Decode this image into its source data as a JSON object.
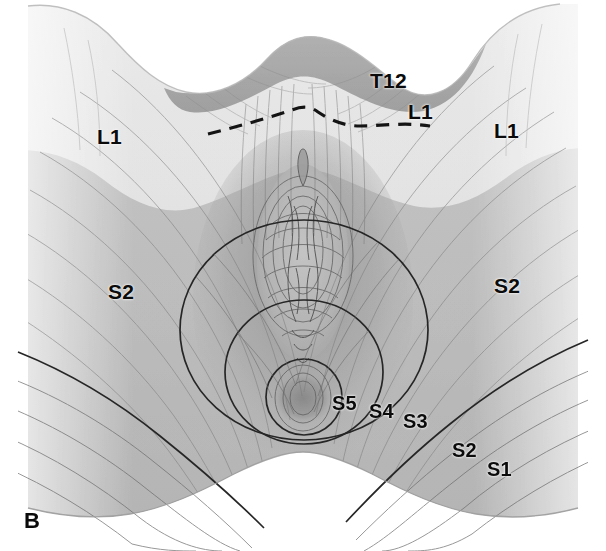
{
  "figure": {
    "panel_label": "B",
    "background_color": "#ffffff",
    "width": 606,
    "height": 551
  },
  "labels": [
    {
      "id": "t12",
      "text": "T12",
      "x": 370,
      "y": 70,
      "size": "lg"
    },
    {
      "id": "l1-center",
      "text": "L1",
      "x": 408,
      "y": 101,
      "size": "lg"
    },
    {
      "id": "l1-left",
      "text": "L1",
      "x": 97,
      "y": 126,
      "size": "lg"
    },
    {
      "id": "l1-right",
      "text": "L1",
      "x": 494,
      "y": 120,
      "size": "lg"
    },
    {
      "id": "s2-left",
      "text": "S2",
      "x": 108,
      "y": 281,
      "size": "lg"
    },
    {
      "id": "s2-right",
      "text": "S2",
      "x": 494,
      "y": 275,
      "size": "lg"
    },
    {
      "id": "s5",
      "text": "S5",
      "x": 332,
      "y": 393,
      "size": "md"
    },
    {
      "id": "s4",
      "text": "S4",
      "x": 369,
      "y": 401,
      "size": "md"
    },
    {
      "id": "s3",
      "text": "S3",
      "x": 403,
      "y": 411,
      "size": "md"
    },
    {
      "id": "s2-lower",
      "text": "S2",
      "x": 452,
      "y": 440,
      "size": "md"
    },
    {
      "id": "s1",
      "text": "S1",
      "x": 487,
      "y": 459,
      "size": "md"
    }
  ],
  "dermatome_zones": [
    {
      "id": "t12",
      "label": "T12",
      "tone": "#9a9a9a",
      "region": "upper lower-back band"
    },
    {
      "id": "l1",
      "label": "L1",
      "tone": "#dcdcdc",
      "region": "buttock upper / flank"
    },
    {
      "id": "s2",
      "label": "S2",
      "tone": "#b4b4b4",
      "region": "medial thigh and buttock"
    },
    {
      "id": "s3",
      "label": "S3",
      "tone": "#aeaeae",
      "region": "outer perianal circle"
    },
    {
      "id": "s4",
      "label": "S4",
      "tone": "#a9a9a9",
      "region": "middle perianal circle"
    },
    {
      "id": "s5",
      "label": "S5",
      "tone": "#a4a4a4",
      "region": "innermost perianal circle"
    },
    {
      "id": "s1",
      "label": "S1",
      "tone": "#a8a8a8",
      "region": "posterior lower thigh"
    }
  ],
  "boundaries": [
    {
      "id": "t12-l1-dashed",
      "style": "dashed",
      "color": "#141414"
    },
    {
      "id": "l1-s2-tonal",
      "style": "tonal",
      "color": "#8d8d8d"
    },
    {
      "id": "s3-circle",
      "style": "solid",
      "color": "#2b2b2b"
    },
    {
      "id": "s4-circle",
      "style": "solid",
      "color": "#2b2b2b"
    },
    {
      "id": "s5-circle",
      "style": "solid",
      "color": "#2b2b2b"
    },
    {
      "id": "s1-s2-curve",
      "style": "solid",
      "color": "#2b2b2b"
    }
  ]
}
